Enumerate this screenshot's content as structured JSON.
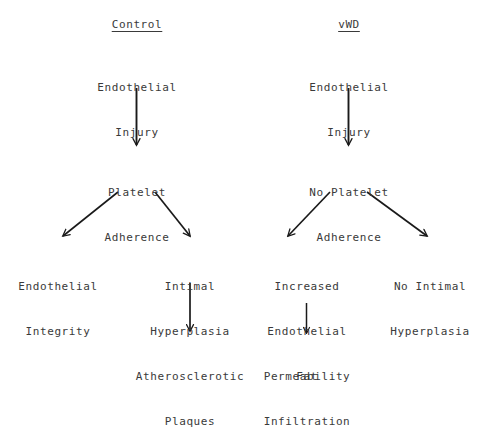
{
  "figure": {
    "type": "flow-diagram",
    "background_color": "#ffffff",
    "text_color": "#3a3a3a",
    "arrow_color": "#1a1a1a",
    "columns": [
      {
        "id": "control",
        "header": "Control"
      },
      {
        "id": "vwd",
        "header": "vWD"
      }
    ]
  },
  "control_branch": {
    "header": "Control",
    "injury": {
      "line1": "Endothelial",
      "line2": "Injury"
    },
    "adherence": {
      "line1": "Platelet",
      "line2": "Adherence"
    },
    "outcome_left": {
      "line1": "Endothelial",
      "line2": "Integrity"
    },
    "outcome_right": {
      "line1": "Intimal",
      "line2": "Hyperplasia"
    },
    "terminal": {
      "line1": "Atherosclerotic",
      "line2": "Plaques"
    }
  },
  "vwd_branch": {
    "header": "vWD",
    "injury": {
      "line1": "Endothelial",
      "line2": "Injury"
    },
    "adherence": {
      "line1": "No Platelet",
      "line2": "Adherence"
    },
    "outcome_left": {
      "line1": "Increased",
      "line2": "Endothelial",
      "line3": "Permeability"
    },
    "outcome_right": {
      "line1": "No Intimal",
      "line2": "Hyperplasia"
    },
    "terminal": {
      "line1": "Fat",
      "line2": "Infiltration"
    }
  }
}
